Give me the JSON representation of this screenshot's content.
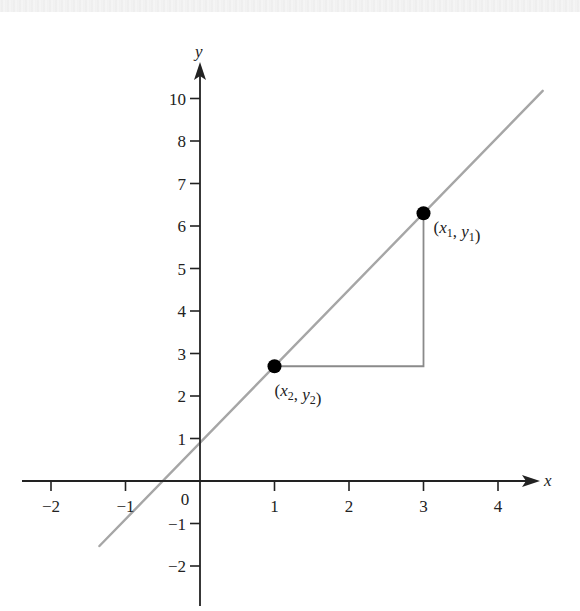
{
  "chart_data": {
    "type": "line",
    "title": "",
    "xlabel": "x",
    "ylabel": "y",
    "xlim": [
      -2.3,
      4.7
    ],
    "ylim": [
      -2.7,
      10.9
    ],
    "grid": false,
    "x_ticks": [
      -2,
      -1,
      1,
      2,
      3,
      4
    ],
    "x_tick_labels": [
      "−2",
      "−1",
      "1",
      "2",
      "3",
      "4"
    ],
    "y_ticks": [
      -2,
      -1,
      1,
      2,
      3,
      4,
      5,
      6,
      7,
      8,
      9
    ],
    "y_tick_labels": [
      "−2",
      "−1",
      "1",
      "2",
      "3",
      "4",
      "5",
      "6",
      "7",
      "8",
      "10"
    ],
    "origin_label": "0",
    "line": {
      "slope": 1.8,
      "intercept": 0.9,
      "x_start": -1.35,
      "x_end": 4.6,
      "color": "#a6a6a6"
    },
    "points": [
      {
        "name": "point-1",
        "x": 3,
        "y": 6.3,
        "label_main": "(x",
        "sub1": "1",
        "mid": ", y",
        "sub2": "1",
        "end": ")"
      },
      {
        "name": "point-2",
        "x": 1,
        "y": 2.7,
        "label_main": "(x",
        "sub1": "2",
        "mid": ", y",
        "sub2": "2",
        "end": ")"
      }
    ],
    "slope_triangle": {
      "corner": [
        3,
        2.7
      ],
      "color": "#8a8a8a"
    }
  },
  "colors": {
    "axis": "#222222",
    "line": "#a6a6a6",
    "point": "#000000",
    "triangle": "#8a8a8a"
  }
}
